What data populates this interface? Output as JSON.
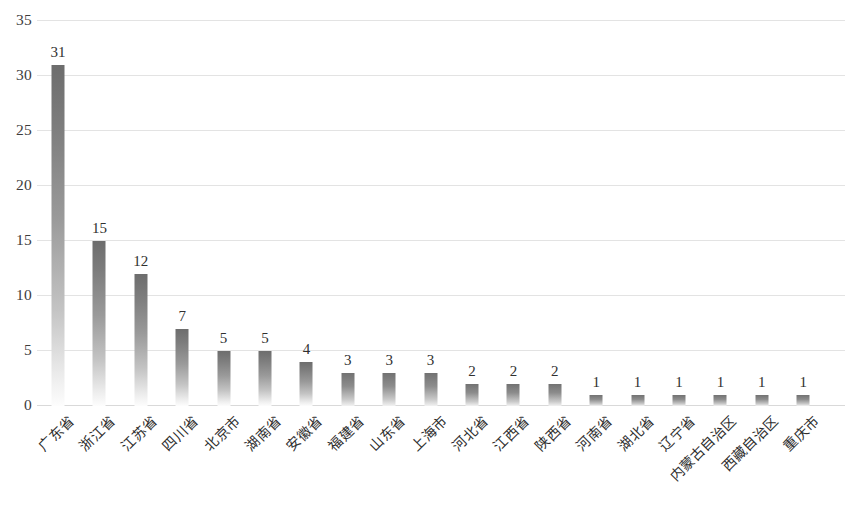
{
  "chart_data": {
    "type": "bar",
    "title": "",
    "xlabel": "",
    "ylabel": "",
    "ylim": [
      0,
      35
    ],
    "ytick_step": 5,
    "yticks": [
      35,
      30,
      25,
      20,
      15,
      10,
      5,
      0
    ],
    "ytick_labels": [
      "35",
      "30",
      "25",
      "20",
      "15",
      "10",
      "5",
      "0"
    ],
    "grid": true,
    "legend": "none",
    "orientation": "vertical",
    "bar_color_top": "#6d6d6d",
    "bar_color_bottom": "#fdfdfd",
    "gridline_color": "#e3e3e3",
    "categories": [
      "广东省",
      "浙江省",
      "江苏省",
      "四川省",
      "北京市",
      "湖南省",
      "安徽省",
      "福建省",
      "山东省",
      "上海市",
      "河北省",
      "江西省",
      "陕西省",
      "河南省",
      "湖北省",
      "辽宁省",
      "内蒙古自治区",
      "西藏自治区",
      "重庆市"
    ],
    "values": [
      31,
      15,
      12,
      7,
      5,
      5,
      4,
      3,
      3,
      3,
      2,
      2,
      2,
      1,
      1,
      1,
      1,
      1,
      1
    ],
    "data_labels": [
      "31",
      "15",
      "12",
      "7",
      "5",
      "5",
      "4",
      "3",
      "3",
      "3",
      "2",
      "2",
      "2",
      "1",
      "1",
      "1",
      "1",
      "1",
      "1"
    ],
    "series": [
      {
        "name": "数量",
        "values": [
          31,
          15,
          12,
          7,
          5,
          5,
          4,
          3,
          3,
          3,
          2,
          2,
          2,
          1,
          1,
          1,
          1,
          1,
          1
        ]
      }
    ]
  }
}
